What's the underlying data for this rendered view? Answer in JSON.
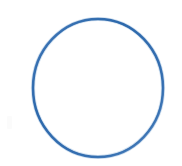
{
  "canvas": {
    "width": 182,
    "height": 166,
    "background_color": "#ffffff",
    "title": "Circle Outline"
  },
  "figure": {
    "type": "circle-outline",
    "label": "blue circle outline",
    "stroke_color": "#3a72b4",
    "stroke_color_light": "#6f9ccd",
    "fill": "none",
    "stroke_width": 2.5,
    "center_x": 98,
    "center_y": 88,
    "radius_x": 65,
    "radius_y": 69,
    "bounds": {
      "left": 33,
      "top": 19,
      "right": 163,
      "bottom": 157
    }
  },
  "artifacts": {
    "smudge_label": "faint scan smudge",
    "smudge_color": "#fbfbfb"
  }
}
